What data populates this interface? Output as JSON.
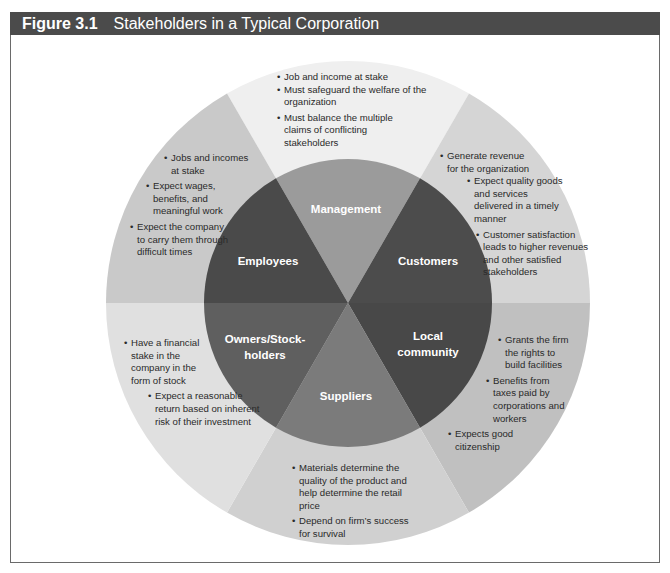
{
  "figure": {
    "number": "Figure 3.1",
    "title": "Stakeholders in a Typical Corporation",
    "colors": {
      "header_bg": "#4b4b4b",
      "frame_border": "#6a6a6a"
    }
  },
  "stakeholders": [
    {
      "id": "management",
      "label": "Management",
      "inner_color": "#9b9b9b",
      "outer_color": "#efefef",
      "notes": [
        "Job and income at stake",
        "Must safeguard the welfare of the organization",
        "Must balance the multiple claims of conflicting stakeholders"
      ]
    },
    {
      "id": "customers",
      "label": "Customers",
      "inner_color": "#4c4c4c",
      "outer_color": "#d5d5d5",
      "notes": [
        "Generate revenue for the organization",
        "Expect quality goods and services delivered in a timely manner",
        "Customer satisfaction leads to higher revenues and other satisfied stakeholders"
      ]
    },
    {
      "id": "local-community",
      "label_line1": "Local",
      "label_line2": "community",
      "inner_color": "#484848",
      "outer_color": "#c0c0c0",
      "notes": [
        "Grants the firm the rights to build facilities",
        "Benefits from taxes paid by corporations and workers",
        "Expects good citizenship"
      ]
    },
    {
      "id": "suppliers",
      "label": "Suppliers",
      "inner_color": "#7b7b7b",
      "outer_color": "#d0d0d0",
      "notes": [
        "Materials determine the quality of the product and help determine the retail price",
        "Depend on firm’s success for survival"
      ]
    },
    {
      "id": "owners-stockholders",
      "label_line1": "Owners/Stock-",
      "label_line2": "holders",
      "inner_color": "#5f5f5f",
      "outer_color": "#e0e0e0",
      "notes": [
        "Have a financial stake in the company in the form of stock",
        "Expect a reasonable return based on inherent risk of their investment"
      ]
    },
    {
      "id": "employees",
      "label": "Employees",
      "inner_color": "#4a4a4a",
      "outer_color": "#c9c9c9",
      "notes": [
        "Jobs and incomes at stake",
        "Expect wages, benefits, and meaningful work",
        "Expect the company to carry them through difficult times"
      ]
    }
  ]
}
